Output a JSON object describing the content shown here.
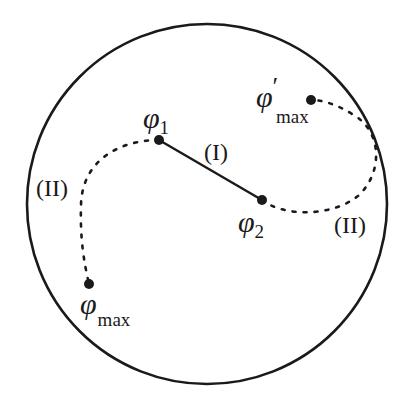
{
  "diagram": {
    "colors": {
      "stroke": "#1a1a1a",
      "background": "#ffffff"
    },
    "boundary": {
      "shape": "circle",
      "cx": 207,
      "cy": 204,
      "r": 180
    },
    "points": [
      {
        "id": "phi1",
        "symbol": "φ",
        "subscript": "1",
        "prime": "",
        "x": 159,
        "y": 140
      },
      {
        "id": "phi2",
        "symbol": "φ",
        "subscript": "2",
        "prime": "",
        "x": 262,
        "y": 200
      },
      {
        "id": "phi_max",
        "symbol": "φ",
        "subscript": "max",
        "prime": "",
        "x": 89,
        "y": 284
      },
      {
        "id": "phi_max_prime",
        "symbol": "φ",
        "subscript": "max",
        "prime": "′",
        "x": 311,
        "y": 100
      }
    ],
    "paths": [
      {
        "id": "path-I",
        "label": "(I)",
        "style": "solid",
        "from": "phi1",
        "to": "phi2"
      },
      {
        "id": "path-II-left",
        "label": "(II)",
        "style": "dotted",
        "from": "phi1",
        "to": "phi_max"
      },
      {
        "id": "path-II-right",
        "label": "(II)",
        "style": "dotted",
        "from": "phi2",
        "to": "phi_max_prime"
      }
    ]
  }
}
